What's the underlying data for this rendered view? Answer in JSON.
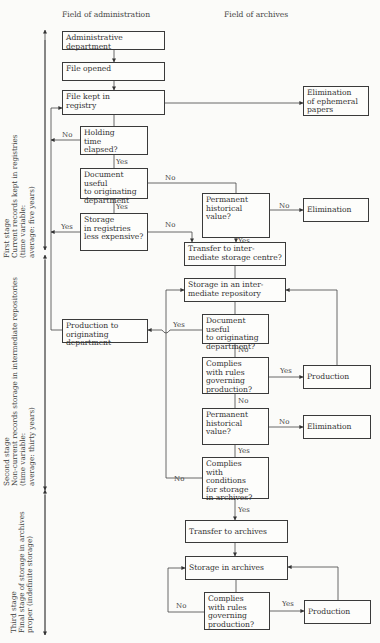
{
  "headers": {
    "administration": "Field of administration",
    "archives": "Field of archives"
  },
  "stages": {
    "first": [
      "First stage",
      "Current records kept in registries",
      "(time variable:",
      "average: five years)"
    ],
    "second": [
      "Second stage",
      "Non-current records storage in intermediate repositories",
      "(time variable:",
      "average: thirty years)"
    ],
    "third": [
      "Third stage",
      "Final stage of storage in archives",
      "proper (indefinite storage)"
    ]
  },
  "nodes": {
    "admin_dept": [
      "Administrative department"
    ],
    "file_opened": [
      "File opened"
    ],
    "file_kept": [
      "File kept in",
      "registry"
    ],
    "elim_ephemeral": [
      "Elimination",
      "of ephemeral",
      "papers"
    ],
    "holding_time": [
      "Holding",
      "time",
      "elapsed?"
    ],
    "doc_useful_1": [
      "Document useful",
      "to originating",
      "department"
    ],
    "perm_hist_1": [
      "Permanent",
      "historical",
      "value?"
    ],
    "elimination_1": [
      "Elimination"
    ],
    "storage_registries": [
      "Storage",
      "in registries",
      "less expensive?"
    ],
    "transfer_intermediate": [
      "Transfer to inter-",
      "mediate storage centre?"
    ],
    "storage_intermediate": [
      "Storage in an inter-",
      "mediate repository"
    ],
    "production_orig": [
      "Production to",
      "originating department"
    ],
    "doc_useful_2": [
      "Document useful",
      "to originating",
      "department?"
    ],
    "complies_rules_2": [
      "Complies",
      "with rules",
      "governing",
      "production?"
    ],
    "production_2": [
      "Production"
    ],
    "perm_hist_2": [
      "Permanent",
      "historical",
      "value?"
    ],
    "elimination_2": [
      "Elimination"
    ],
    "complies_conditions": [
      "Complies",
      "with conditions",
      "for storage",
      "in archives?"
    ],
    "transfer_archives": [
      "Transfer to archives"
    ],
    "storage_archives": [
      "Storage in archives"
    ],
    "complies_rules_3": [
      "Complies",
      "with rules",
      "governing",
      "production?"
    ],
    "production_3": [
      "Production"
    ]
  },
  "edge_labels": {
    "holding_no": "No",
    "holding_yes": "Yes",
    "doc1_no": "No",
    "doc1_yes": "Yes",
    "perm1_no": "No",
    "perm1_yes": "Yes",
    "storreg_yes": "Yes",
    "storreg_no": "No",
    "doc2_yes": "Yes",
    "doc2_no": "No",
    "comp2_yes": "Yes",
    "comp2_no": "No",
    "perm2_no": "No",
    "perm2_yes": "Yes",
    "cond_no": "No",
    "cond_yes": "Yes",
    "comp3_no": "No",
    "comp3_yes": "Yes"
  }
}
